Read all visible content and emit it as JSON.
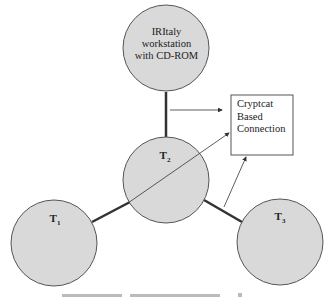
{
  "diagram": {
    "nodes": {
      "workstation": {
        "label": "IRItaly workstation with CD-ROM",
        "lines": [
          "IRItaly",
          "workstation",
          "with CD-ROM"
        ]
      },
      "t1": {
        "label": "T",
        "sub": "1"
      },
      "t2": {
        "label": "T",
        "sub": "2"
      },
      "t3": {
        "label": "T",
        "sub": "3"
      }
    },
    "connection_box": {
      "lines": [
        "Cryptcat",
        "Based",
        "Connection"
      ]
    },
    "colors": {
      "node_fill": "#d9d9d9",
      "stroke": "#444444",
      "edge": "#333333"
    }
  }
}
